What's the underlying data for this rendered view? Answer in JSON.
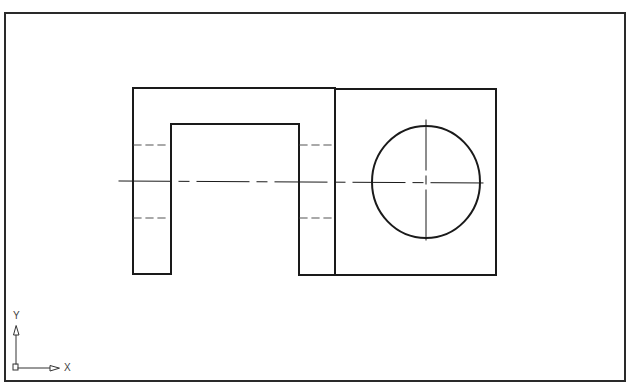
{
  "drawing": {
    "title": "",
    "colors": {
      "background": "#ffffff",
      "frame": "#2a2a2a",
      "object_line": "#1a1a1a",
      "hidden_line": "#555555",
      "center_line": "#1a1a1a"
    },
    "front_view": {
      "outline": [
        [
          133,
          88
        ],
        [
          335,
          88
        ],
        [
          335,
          275
        ],
        [
          299,
          275
        ],
        [
          299,
          124
        ],
        [
          171,
          124
        ],
        [
          171,
          274
        ],
        [
          133,
          274
        ]
      ],
      "hidden_lines": [
        {
          "x1": 133,
          "y1": 145,
          "x2": 171,
          "y2": 145
        },
        {
          "x1": 133,
          "y1": 218,
          "x2": 171,
          "y2": 218
        },
        {
          "x1": 299,
          "y1": 145,
          "x2": 335,
          "y2": 145
        },
        {
          "x1": 299,
          "y1": 218,
          "x2": 335,
          "y2": 218
        }
      ]
    },
    "side_view": {
      "rect": {
        "x": 335,
        "y": 88,
        "width": 161,
        "height": 187
      },
      "circle": {
        "cx": 426,
        "cy": 182,
        "r": 55
      }
    },
    "center_lines": {
      "horizontal": {
        "x1": 119,
        "y1": 181,
        "x2": 487,
        "y2": 183
      },
      "vertical": {
        "x1": 426,
        "y1": 120,
        "x2": 426,
        "y2": 245
      }
    }
  },
  "ucs_icon": {
    "x_label": "X",
    "y_label": "Y"
  }
}
